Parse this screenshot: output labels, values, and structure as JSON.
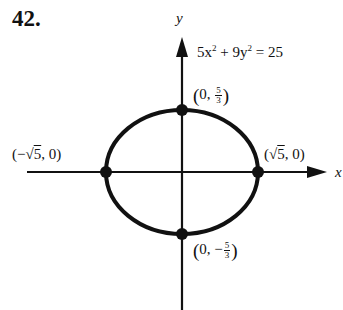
{
  "problem": {
    "number": "42."
  },
  "axes": {
    "x_label": "x",
    "y_label": "y"
  },
  "equation": {
    "text": "5x² + 9y² = 25",
    "a": "5x",
    "b": "9y",
    "rhs": "= 25",
    "plus": "+",
    "exp": "2"
  },
  "points": {
    "top": {
      "label": "(0, 5/3)",
      "x": "0",
      "num": "5",
      "den": "3",
      "sign": ""
    },
    "bottom": {
      "label": "(0, -5/3)",
      "x": "0",
      "num": "5",
      "den": "3",
      "sign": "−"
    },
    "left": {
      "label": "(−√5, 0)",
      "prefix": "(−√",
      "rad": "5",
      "suffix": ", 0)"
    },
    "right": {
      "label": "(√5, 0)",
      "prefix": "(√",
      "rad": "5",
      "suffix": ", 0)"
    }
  },
  "colors": {
    "ink": "#111111",
    "background": "#ffffff"
  }
}
